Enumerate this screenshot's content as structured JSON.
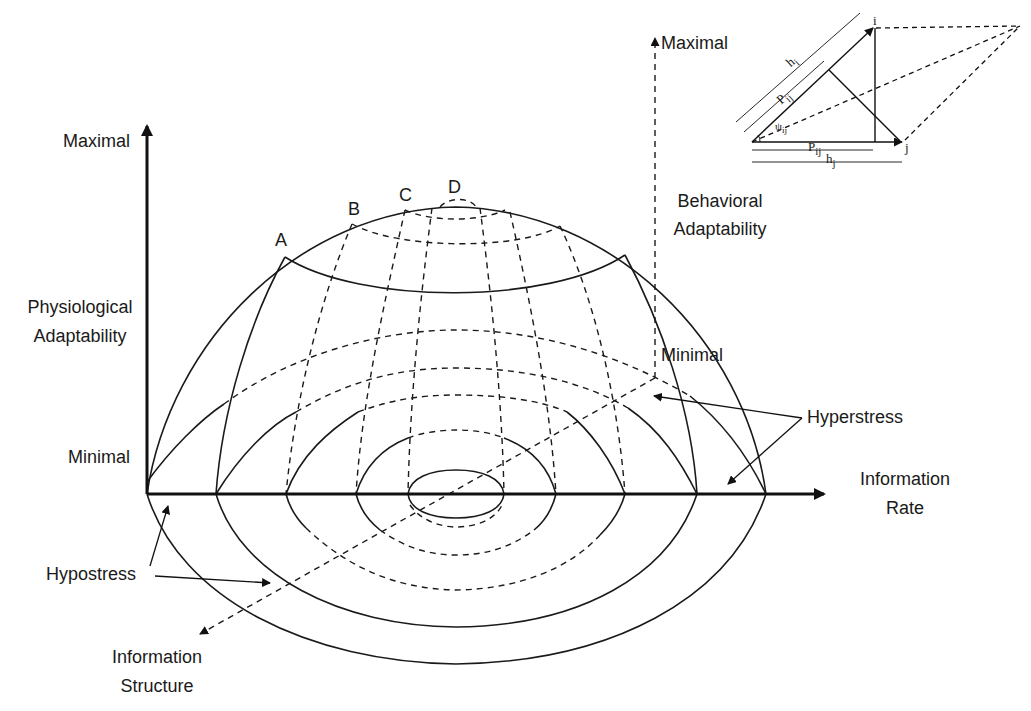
{
  "diagram": {
    "axes": {
      "vertical_physiological": {
        "label_line1": "Physiological",
        "label_line2": "Adaptability",
        "max_label": "Maximal",
        "min_label": "Minimal"
      },
      "vertical_behavioral": {
        "label_line1": "Behavioral",
        "label_line2": "Adaptability",
        "max_label": "Maximal",
        "min_label": "Minimal"
      },
      "horizontal": {
        "label_line1": "Information",
        "label_line2": "Rate"
      },
      "depth": {
        "label_line1": "Information",
        "label_line2": "Structure"
      }
    },
    "zone_labels": {
      "hyperstress": "Hyperstress",
      "hypostress": "Hypostress"
    },
    "point_labels": [
      "A",
      "B",
      "C",
      "D"
    ],
    "inset": {
      "vertex_i": "i",
      "vertex_j": "j",
      "h_i": "h",
      "h_i_sub": "i",
      "p_ij_diag": "P",
      "p_ij_diag_sub": "ij",
      "angle": "ψ",
      "angle_sub": "ij",
      "p_ij_base": "P",
      "p_ij_base_sub": "ij",
      "h_j": "h",
      "h_j_sub": "j"
    }
  }
}
